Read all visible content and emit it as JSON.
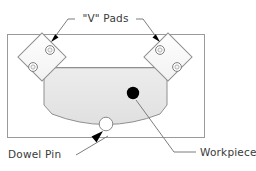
{
  "diagram": {
    "type": "engineering-fixture-plan-view",
    "labels": {
      "v_pads": "\"V\" Pads",
      "dowel_pin": "Dowel Pin",
      "workpiece": "Workpiece"
    },
    "colors": {
      "outline": "#8a8a8a",
      "outline_dark": "#555555",
      "workpiece_fill": "#e8e8e8",
      "pad_fill": "#fdfdfd",
      "hole_fill": "#ffffff",
      "center_dot": "#000000",
      "arrow": "#000000",
      "text": "#3a3a3a",
      "background": "#ffffff"
    },
    "components": [
      {
        "name": "base-plate",
        "shape": "rectangle",
        "x": 7,
        "y": 34,
        "width": 198,
        "height": 104
      },
      {
        "name": "v-pad-left",
        "shape": "rotated-square",
        "center_x": 42,
        "center_y": 57,
        "size": 34,
        "rotation_deg": 45,
        "hole_count": 2
      },
      {
        "name": "v-pad-right",
        "shape": "rotated-square",
        "center_x": 168,
        "center_y": 57,
        "size": 34,
        "rotation_deg": 45,
        "hole_count": 2
      },
      {
        "name": "workpiece",
        "shape": "flat-top-arc-bottom",
        "top_y": 67,
        "left_x": 44,
        "right_x": 167,
        "bottom_y": 118
      },
      {
        "name": "dowel-pin",
        "shape": "circle",
        "center_x": 106,
        "center_y": 124,
        "radius": 7
      },
      {
        "name": "workpiece-center-dot",
        "shape": "filled-circle",
        "center_x": 133,
        "center_y": 93,
        "radius": 6
      }
    ],
    "leaders": [
      {
        "name": "leader-v-pads-left",
        "target": "v-pad-left",
        "arrowhead": true
      },
      {
        "name": "leader-v-pads-right",
        "target": "v-pad-right",
        "arrowhead": true
      },
      {
        "name": "leader-dowel-pin",
        "target": "dowel-pin",
        "arrowhead": true
      },
      {
        "name": "leader-workpiece",
        "target": "workpiece-center-dot",
        "arrowhead": false
      }
    ]
  }
}
